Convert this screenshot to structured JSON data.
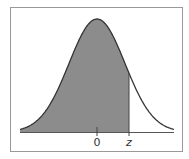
{
  "chart_data": {
    "type": "area",
    "title": "",
    "xlabel": "",
    "ylabel": "",
    "tick_labels": [
      "0",
      "z"
    ],
    "shaded_region": {
      "from": "-inf",
      "to": "z"
    },
    "z_value_approx": 1.0,
    "colors": {
      "shade": "#8c8c8c",
      "curve": "#333333",
      "frame": "#999999"
    }
  },
  "labels": {
    "zero": "0",
    "z": "z"
  }
}
